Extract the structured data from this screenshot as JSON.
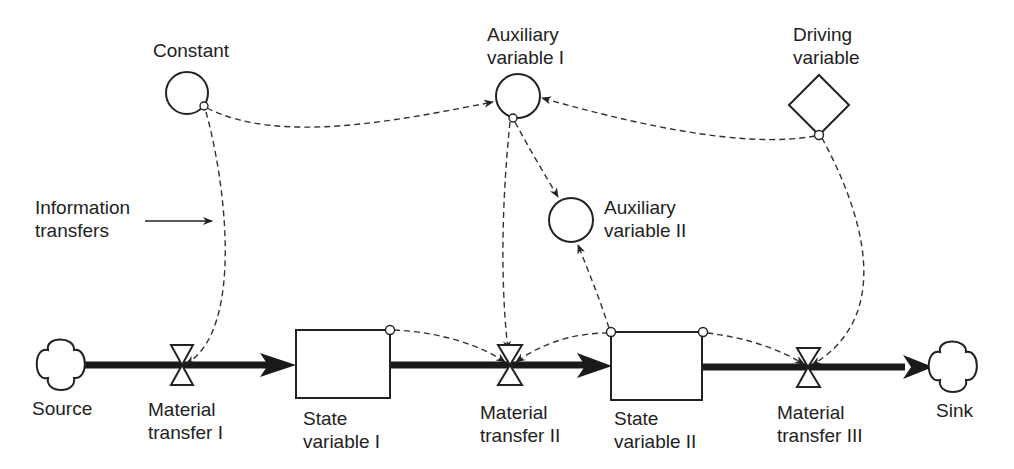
{
  "diagram": {
    "type": "system-dynamics stock-flow diagram",
    "background": "#ffffff",
    "ink_color": "#222222",
    "nodes": {
      "constant": {
        "label": "Constant",
        "shape": "circle"
      },
      "aux1": {
        "label_line1": "Auxiliary",
        "label_line2": "variable I",
        "shape": "circle"
      },
      "aux2": {
        "label_line1": "Auxiliary",
        "label_line2": "variable II",
        "shape": "circle"
      },
      "driving": {
        "label_line1": "Driving",
        "label_line2": "variable",
        "shape": "diamond"
      },
      "source": {
        "label": "Source",
        "shape": "cloud"
      },
      "sink": {
        "label": "Sink",
        "shape": "cloud"
      },
      "valve1": {
        "label_line1": "Material",
        "label_line2": "transfer I",
        "shape": "valve"
      },
      "valve2": {
        "label_line1": "Material",
        "label_line2": "transfer II",
        "shape": "valve"
      },
      "valve3": {
        "label_line1": "Material",
        "label_line2": "transfer III",
        "shape": "valve"
      },
      "state1": {
        "label_line1": "State",
        "label_line2": "variable I",
        "shape": "rectangle"
      },
      "state2": {
        "label_line1": "State",
        "label_line2": "variable II",
        "shape": "rectangle"
      }
    },
    "annotation": {
      "label_line1": "Information",
      "label_line2": "transfers"
    },
    "material_flows": [
      {
        "from": "Source",
        "via": "Material transfer I",
        "to": "State variable I"
      },
      {
        "from": "State variable I",
        "via": "Material transfer II",
        "to": "State variable II"
      },
      {
        "from": "State variable II",
        "via": "Material transfer III",
        "to": "Sink"
      }
    ],
    "information_links": [
      {
        "from": "Constant",
        "to": "Auxiliary variable I"
      },
      {
        "from": "Constant",
        "to": "Material transfer I"
      },
      {
        "from": "Auxiliary variable I",
        "to": "Auxiliary variable II"
      },
      {
        "from": "Auxiliary variable I",
        "to": "Material transfer II"
      },
      {
        "from": "Driving variable",
        "to": "Auxiliary variable I"
      },
      {
        "from": "Driving variable",
        "to": "Material transfer III"
      },
      {
        "from": "State variable I",
        "to": "Material transfer II"
      },
      {
        "from": "State variable II",
        "to": "Material transfer II"
      },
      {
        "from": "State variable II",
        "to": "Auxiliary variable II"
      },
      {
        "from": "State variable II",
        "to": "Material transfer III"
      }
    ]
  }
}
